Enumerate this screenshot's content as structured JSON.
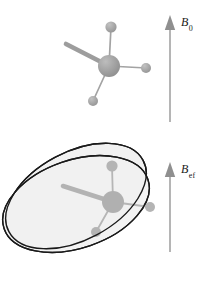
{
  "figure": {
    "title": "",
    "width": 205,
    "height": 289,
    "background_color": "#ffffff"
  },
  "labels": {
    "static_field": {
      "symbol": "B",
      "subscript": "0",
      "full": "B0"
    },
    "effective_field": {
      "symbol": "B",
      "subscript": "ef",
      "full": "Bef"
    }
  },
  "arrows": [
    {
      "name": "b0-arrow",
      "label": "B0",
      "x": 170,
      "tip_y": 16,
      "tail_y": 122,
      "direction": "up",
      "color": "#9a9a9a",
      "head_color": "#8f8f8f"
    },
    {
      "name": "beff-arrow",
      "label": "Bef",
      "x": 170,
      "tip_y": 163,
      "tail_y": 252,
      "direction": "up",
      "color": "#9a9a9a",
      "head_color": "#8f8f8f"
    }
  ],
  "molecules": [
    {
      "name": "upper-molecule",
      "center": {
        "x": 109,
        "y": 66
      },
      "center_radius": 11,
      "atom_color": "#9d9d9d",
      "bond_color": "#9d9d9d",
      "bonds": [
        {
          "name": "thick-bond-upper-left",
          "to": {
            "x": 66,
            "y": 44
          },
          "width": 4.5,
          "terminal_atom": false
        },
        {
          "name": "bond-to-top-atom",
          "to": {
            "x": 111,
            "y": 27
          },
          "width": 1.6,
          "terminal_atom": true,
          "atom_radius": 5.5
        },
        {
          "name": "bond-to-right-atom",
          "to": {
            "x": 146,
            "y": 68
          },
          "width": 1.6,
          "terminal_atom": true,
          "atom_radius": 5
        },
        {
          "name": "bond-to-lower-left-atom",
          "to": {
            "x": 93,
            "y": 101
          },
          "width": 1.6,
          "terminal_atom": true,
          "atom_radius": 5
        }
      ]
    },
    {
      "name": "lower-molecule",
      "center": {
        "x": 113,
        "y": 202
      },
      "center_radius": 11,
      "atom_color": "#9d9d9d",
      "bond_color": "#9d9d9d",
      "bonds": [
        {
          "name": "thick-bond-upper-left",
          "to": {
            "x": 63,
            "y": 186
          },
          "width": 4.5,
          "terminal_atom": false
        },
        {
          "name": "bond-to-top-atom",
          "to": {
            "x": 112,
            "y": 166
          },
          "width": 1.6,
          "terminal_atom": true,
          "atom_radius": 5.5
        },
        {
          "name": "bond-to-right-atom",
          "to": {
            "x": 148,
            "y": 207
          },
          "width": 1.6,
          "terminal_atom": true,
          "atom_radius": 5
        },
        {
          "name": "bond-to-lower-left-atom",
          "to": {
            "x": 96,
            "y": 232
          },
          "width": 1.6,
          "terminal_atom": true,
          "atom_radius": 5
        }
      ]
    }
  ],
  "precession_cones": {
    "name": "precession-ellipses",
    "fill_color": "#f0f0f0",
    "stroke_color": "#1a1a1a",
    "stroke_width": 1.3,
    "ellipses": [
      {
        "name": "ellipse-back",
        "cx": 76,
        "cy": 196,
        "rx": 76,
        "ry": 44,
        "rotation": -28
      },
      {
        "name": "ellipse-front",
        "cx": 76,
        "cy": 204,
        "rx": 76,
        "ry": 44,
        "rotation": -19
      }
    ]
  }
}
